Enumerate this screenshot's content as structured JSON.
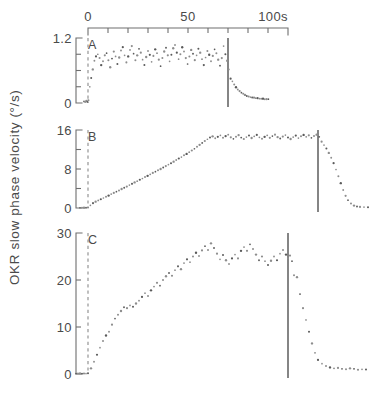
{
  "figure": {
    "y_axis_label": "OKR slow phase velocity (°/s)",
    "time_axis_unit_label": "100s"
  },
  "chart_data": {
    "type": "scatter",
    "title": "",
    "xlabel": "",
    "ylabel": "OKR slow phase velocity (°/s)",
    "shared_x_axis": {
      "position": "top",
      "xlim": [
        0,
        100
      ],
      "tick_values": [
        0,
        10,
        20,
        30,
        40,
        50,
        60,
        70,
        80,
        90,
        100
      ],
      "labeled_ticks": [
        {
          "value": 0,
          "label": "0"
        },
        {
          "value": 50,
          "label": "50"
        },
        {
          "value": 100,
          "label": "100s"
        }
      ],
      "units": "s",
      "grid": false,
      "legend": "none"
    },
    "panels": [
      {
        "letter": "A",
        "ylim": [
          0,
          1.2
        ],
        "y_labeled_ticks": [
          {
            "value": 0,
            "label": "0"
          },
          {
            "value": 1.2,
            "label": "1.2"
          }
        ],
        "y_minor_ticks": [
          0.3,
          0.6,
          0.9
        ],
        "stimulus_onset_time": 0,
        "event_marker_time": 70,
        "description": "Noisy scatter band rising rapidly to a plateau near 0.85-1.0 deg/s, then decaying after the event marker.",
        "x": [
          -2.0,
          -1.4,
          -0.8,
          -0.3,
          0.2,
          0.9,
          1.6,
          2.4,
          3.2,
          4.0,
          4.9,
          5.8,
          6.6,
          7.5,
          8.4,
          9.3,
          10.2,
          11.1,
          12.0,
          12.9,
          13.8,
          14.7,
          15.6,
          16.5,
          17.4,
          18.3,
          19.2,
          20.1,
          21.0,
          21.9,
          22.8,
          23.7,
          24.6,
          25.5,
          26.4,
          27.3,
          28.2,
          29.1,
          30.0,
          30.9,
          31.8,
          32.7,
          33.6,
          34.5,
          35.4,
          36.3,
          37.2,
          38.1,
          39.0,
          39.9,
          40.8,
          41.7,
          42.6,
          43.5,
          44.4,
          45.3,
          46.2,
          47.1,
          48.0,
          48.9,
          49.8,
          50.7,
          51.6,
          52.5,
          53.4,
          54.3,
          55.2,
          56.1,
          57.0,
          57.9,
          58.8,
          59.7,
          60.6,
          61.5,
          62.4,
          63.3,
          64.2,
          65.1,
          66.0,
          66.9,
          67.8,
          68.7,
          69.6,
          70.4,
          71.3,
          72.2,
          73.1,
          74.0,
          74.9,
          75.8,
          76.7,
          77.6,
          78.5,
          79.4,
          80.3,
          81.2,
          82.1,
          83.0,
          83.9,
          84.8,
          85.7,
          86.6,
          87.5,
          88.4,
          89.3,
          90.2
        ],
        "y": [
          0.03,
          0.02,
          0.04,
          0.02,
          0.05,
          0.3,
          0.46,
          0.62,
          0.78,
          0.86,
          0.9,
          0.83,
          0.7,
          0.77,
          0.88,
          0.92,
          0.79,
          0.66,
          0.82,
          0.95,
          0.86,
          0.72,
          0.84,
          0.97,
          1.03,
          0.88,
          0.75,
          0.86,
          0.98,
          1.05,
          0.91,
          0.79,
          0.88,
          1.0,
          0.93,
          0.8,
          0.7,
          0.85,
          0.96,
          0.89,
          0.76,
          0.87,
          0.99,
          0.92,
          0.8,
          0.68,
          0.83,
          0.95,
          1.02,
          0.88,
          0.77,
          0.89,
          1.01,
          1.07,
          0.93,
          0.81,
          0.9,
          1.03,
          0.95,
          0.83,
          0.72,
          0.86,
          0.98,
          0.91,
          0.79,
          0.88,
          1.0,
          0.93,
          0.81,
          0.7,
          0.84,
          0.96,
          0.89,
          0.77,
          0.87,
          0.99,
          0.92,
          0.8,
          0.69,
          0.83,
          1.05,
          0.9,
          0.78,
          0.62,
          0.45,
          0.4,
          0.34,
          0.29,
          0.25,
          0.22,
          0.19,
          0.17,
          0.15,
          0.13,
          0.12,
          0.11,
          0.1,
          0.1,
          0.09,
          0.09,
          0.08,
          0.08,
          0.08,
          0.07,
          0.07,
          0.07
        ]
      },
      {
        "letter": "B",
        "ylim": [
          0,
          16
        ],
        "y_labeled_ticks": [
          {
            "value": 0,
            "label": "0"
          },
          {
            "value": 8,
            "label": "8"
          },
          {
            "value": 16,
            "label": "16"
          }
        ],
        "y_minor_ticks": [
          4,
          12
        ],
        "stimulus_onset_time": 0,
        "event_marker_time": 115,
        "description": "Slow near-linear ramp from 0 to a plateau around 14-15 deg/s, held until the event marker, then a steep decay to baseline.",
        "x": [
          -4.0,
          -3.0,
          -2.0,
          -1.0,
          0.0,
          1.2,
          2.5,
          3.8,
          5.1,
          6.4,
          7.7,
          9.0,
          10.3,
          11.6,
          12.9,
          14.2,
          15.5,
          16.8,
          18.1,
          19.4,
          20.7,
          22.0,
          23.3,
          24.6,
          25.9,
          27.2,
          28.5,
          29.8,
          31.1,
          32.4,
          33.7,
          35.0,
          36.3,
          37.6,
          38.9,
          40.2,
          41.5,
          42.8,
          44.1,
          45.4,
          46.7,
          48.0,
          49.3,
          50.6,
          51.9,
          53.2,
          54.5,
          55.8,
          57.1,
          58.4,
          59.7,
          61.0,
          62.3,
          63.6,
          64.9,
          66.2,
          67.5,
          68.8,
          70.1,
          71.4,
          72.7,
          74.0,
          75.3,
          76.6,
          77.9,
          79.2,
          80.5,
          81.8,
          83.1,
          84.4,
          85.7,
          87.0,
          88.3,
          89.6,
          90.9,
          92.2,
          93.5,
          94.8,
          96.1,
          97.4,
          98.7,
          100.0,
          101.3,
          102.6,
          103.9,
          105.2,
          106.5,
          107.8,
          109.1,
          110.4,
          111.7,
          113.0,
          114.3,
          115.6,
          116.8,
          118.0,
          119.2,
          120.4,
          121.6,
          122.8,
          124.0,
          125.2,
          126.4,
          127.6,
          128.8,
          130.0,
          131.5,
          133.0,
          134.5,
          136.0,
          138.0,
          140.0
        ],
        "y": [
          0.05,
          0.04,
          0.06,
          0.05,
          0.1,
          0.55,
          1.0,
          1.3,
          1.55,
          1.8,
          2.05,
          2.3,
          2.55,
          2.85,
          3.1,
          3.35,
          3.6,
          3.9,
          4.15,
          4.4,
          4.7,
          4.95,
          5.25,
          5.5,
          5.8,
          6.05,
          6.35,
          6.6,
          6.9,
          7.2,
          7.45,
          7.75,
          8.0,
          8.3,
          8.6,
          8.9,
          9.2,
          9.5,
          9.85,
          10.15,
          10.45,
          10.8,
          11.1,
          11.45,
          11.8,
          12.15,
          12.55,
          12.95,
          13.35,
          13.75,
          14.1,
          14.45,
          14.7,
          14.3,
          14.6,
          14.9,
          14.4,
          14.75,
          15.05,
          14.5,
          14.2,
          14.6,
          14.95,
          14.45,
          14.15,
          14.55,
          14.85,
          14.35,
          14.7,
          15.0,
          14.5,
          14.2,
          14.6,
          14.9,
          14.4,
          14.75,
          15.05,
          14.55,
          14.25,
          14.65,
          14.95,
          14.45,
          14.15,
          14.55,
          14.85,
          14.35,
          14.7,
          15.0,
          14.6,
          14.9,
          14.4,
          14.75,
          15.05,
          14.6,
          13.6,
          12.9,
          12.2,
          11.3,
          10.3,
          9.2,
          7.9,
          6.5,
          5.1,
          3.7,
          2.5,
          1.6,
          0.9,
          0.5,
          0.3,
          0.22,
          0.18,
          0.15
        ]
      },
      {
        "letter": "C",
        "ylim": [
          0,
          30
        ],
        "y_labeled_ticks": [
          {
            "value": 0,
            "label": "0"
          },
          {
            "value": 10,
            "label": "10"
          },
          {
            "value": 20,
            "label": "20"
          },
          {
            "value": 30,
            "label": "30"
          }
        ],
        "y_minor_ticks": [],
        "stimulus_onset_time": 0,
        "event_marker_time": 100,
        "description": "Steep noisy rise to a fluctuating plateau near 24-28 deg/s, then an abrupt drop to baseline after the event marker.",
        "x": [
          -6.0,
          -5.0,
          -4.0,
          -3.0,
          -2.0,
          -1.0,
          0.0,
          1.5,
          3.0,
          4.5,
          6.0,
          7.5,
          9.0,
          10.5,
          12.0,
          13.5,
          15.0,
          16.5,
          18.0,
          19.5,
          21.0,
          22.5,
          24.0,
          25.5,
          27.0,
          28.5,
          30.0,
          31.5,
          33.0,
          34.5,
          36.0,
          37.5,
          39.0,
          40.5,
          42.0,
          43.5,
          45.0,
          46.5,
          48.0,
          49.5,
          51.0,
          52.5,
          54.0,
          55.5,
          57.0,
          58.5,
          60.0,
          61.5,
          63.0,
          64.5,
          66.0,
          67.5,
          69.0,
          70.5,
          72.0,
          73.5,
          75.0,
          76.5,
          78.0,
          79.5,
          81.0,
          82.5,
          84.0,
          85.5,
          87.0,
          88.5,
          90.0,
          91.5,
          93.0,
          94.5,
          96.0,
          97.5,
          99.0,
          100.0,
          101.0,
          102.0,
          103.0,
          104.5,
          106.0,
          107.5,
          109.0,
          110.5,
          112.0,
          113.5,
          115.0,
          117.0,
          119.0,
          121.0,
          123.0,
          125.0,
          127.0,
          129.0,
          131.0,
          133.0,
          135.0,
          137.0,
          139.0
        ],
        "y": [
          0.1,
          0.08,
          0.12,
          0.09,
          0.11,
          0.1,
          0.15,
          1.2,
          2.6,
          4.1,
          5.6,
          7.0,
          8.2,
          9.0,
          10.5,
          11.8,
          12.6,
          13.4,
          14.2,
          14.0,
          14.6,
          14.3,
          15.0,
          15.6,
          16.4,
          17.2,
          16.6,
          17.8,
          18.6,
          19.4,
          18.8,
          20.0,
          20.8,
          21.5,
          20.9,
          22.1,
          22.9,
          22.3,
          23.6,
          24.4,
          23.8,
          25.0,
          25.8,
          25.1,
          26.3,
          27.2,
          26.4,
          27.8,
          26.8,
          25.6,
          24.4,
          25.3,
          24.2,
          23.4,
          24.6,
          25.4,
          24.6,
          26.2,
          27.0,
          26.2,
          27.6,
          26.6,
          25.4,
          24.2,
          25.0,
          24.0,
          23.2,
          24.1,
          25.0,
          24.2,
          25.6,
          26.4,
          25.4,
          24.6,
          25.2,
          24.0,
          21.0,
          20.6,
          17.0,
          14.0,
          11.5,
          9.0,
          6.5,
          4.5,
          3.0,
          2.2,
          1.7,
          1.4,
          1.2,
          1.3,
          1.1,
          1.0,
          1.2,
          1.1,
          0.9,
          1.0,
          0.95
        ]
      }
    ]
  }
}
